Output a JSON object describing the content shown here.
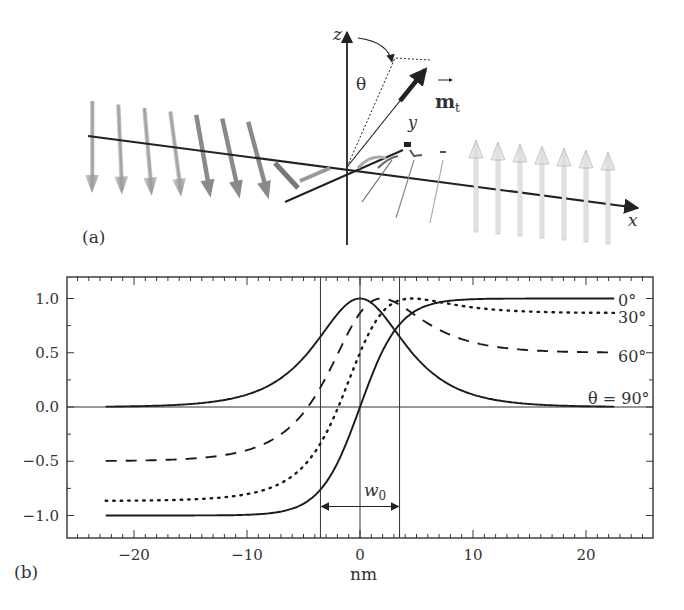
{
  "panel_a": {
    "label": "(a)",
    "axes": {
      "z": "z",
      "y": "y",
      "x": "x"
    },
    "angle_label": "θ",
    "vector_label": "m",
    "vector_subscript": "t",
    "left_arrows": 7,
    "right_arrows": 10
  },
  "panel_b": {
    "label": "(b)",
    "xlabel": "nm",
    "width_label": "w",
    "width_subscript": "0",
    "curve_labels": [
      "0°",
      "30°",
      "60°",
      "θ = 90°"
    ]
  },
  "chart_data": {
    "type": "line",
    "title": "",
    "xlabel": "nm",
    "ylabel": "",
    "xlim": [
      -26,
      26
    ],
    "ylim": [
      -1.2,
      1.2
    ],
    "xticks": [
      -20,
      -10,
      0,
      10,
      20
    ],
    "yticks": [
      -1.0,
      -0.5,
      0.0,
      0.5,
      1.0
    ],
    "ytick_labels": [
      "−1.0",
      "−0.5",
      "0.0",
      "0.5",
      "1.0"
    ],
    "xtick_labels": [
      "−20",
      "−10",
      "0",
      "10",
      "20"
    ],
    "grid": false,
    "vertical_lines": [
      -3.5,
      0,
      3.5
    ],
    "horizontal_lines": [
      0
    ],
    "annotation": {
      "text": "w0",
      "from": -3.5,
      "to": 3.5,
      "y": -1.0
    },
    "x_range": [
      -22.5,
      22.5
    ],
    "width_w0": 3.5,
    "series": [
      {
        "name": "0°",
        "theta_deg": 0,
        "style": "solid",
        "start": -1.0,
        "end": 1.0
      },
      {
        "name": "30°",
        "theta_deg": 30,
        "style": "dotted",
        "start": -0.87,
        "peak": 1.0,
        "end": 0.87
      },
      {
        "name": "60°",
        "theta_deg": 60,
        "style": "dashed",
        "start": -0.5,
        "peak": 1.0,
        "end": 0.5
      },
      {
        "name": "θ = 90°",
        "theta_deg": 90,
        "style": "solid",
        "start": 0.0,
        "peak": 1.0,
        "end": 0.0
      }
    ]
  }
}
